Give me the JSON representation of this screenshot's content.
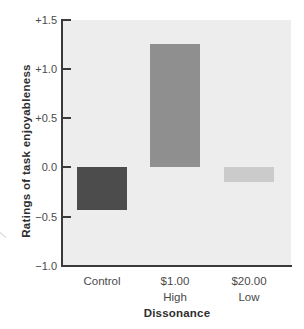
{
  "chart_data": {
    "type": "bar",
    "title": "",
    "xlabel": "Dissonance",
    "ylabel": "Ratings of task enjoyableness",
    "categories": [
      "Control",
      "$1.00\nHigh",
      "$20.00\nLow"
    ],
    "values": [
      -0.43,
      1.25,
      -0.15
    ],
    "ylim": [
      -1.0,
      1.5
    ],
    "y_ticks": [
      "+1.5",
      "+1.0",
      "+0.5",
      "0.0",
      "−0.5",
      "−1.0"
    ],
    "y_tick_values": [
      1.5,
      1.0,
      0.5,
      0.0,
      -0.5,
      -1.0
    ],
    "grid": false,
    "legend": "none",
    "colors": {
      "bar_colors": [
        "#4c4c4c",
        "#8f8f8f",
        "#cbcbcb"
      ],
      "plot_background": "#ededed",
      "axis": "#3a3a3a",
      "page_background": "#ffffff"
    }
  }
}
